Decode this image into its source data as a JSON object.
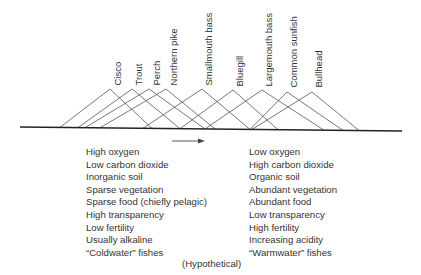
{
  "diagram": {
    "baseline": {
      "x1": 20,
      "y1": 127,
      "x2": 402,
      "y2": 131
    },
    "species": [
      {
        "name": "Cisco",
        "peak": [
          110,
          89
        ],
        "left_foot": 60,
        "right_foot": 152,
        "label_x": 113,
        "label_y": 85
      },
      {
        "name": "Trout",
        "peak": [
          132,
          89
        ],
        "left_foot": 78,
        "right_foot": 180,
        "label_x": 134,
        "label_y": 85
      },
      {
        "name": "Perch",
        "peak": [
          149,
          89
        ],
        "left_foot": 85,
        "right_foot": 205,
        "label_x": 152,
        "label_y": 85
      },
      {
        "name": "Northern pike",
        "peak": [
          166,
          89
        ],
        "left_foot": 100,
        "right_foot": 215,
        "label_x": 169,
        "label_y": 85
      },
      {
        "name": "Smallmouth bass",
        "peak": [
          202,
          89
        ],
        "left_foot": 143,
        "right_foot": 250,
        "label_x": 204,
        "label_y": 85
      },
      {
        "name": "Bluegill",
        "peak": [
          233,
          90
        ],
        "left_foot": 180,
        "right_foot": 278,
        "label_x": 235,
        "label_y": 86
      },
      {
        "name": "Largemouth bass",
        "peak": [
          262,
          90
        ],
        "left_foot": 205,
        "right_foot": 324,
        "label_x": 264,
        "label_y": 86
      },
      {
        "name": "Common sunfish",
        "peak": [
          287,
          92
        ],
        "left_foot": 250,
        "right_foot": 343,
        "label_x": 289,
        "label_y": 87
      },
      {
        "name": "Bullhead",
        "peak": [
          312,
          92
        ],
        "left_foot": 252,
        "right_foot": 359,
        "label_x": 314,
        "label_y": 87
      }
    ],
    "arrow": "→"
  },
  "conditions": {
    "left": [
      "High oxygen",
      "Low carbon dioxide",
      "Inorganic soil",
      "Sparse vegetation",
      "Sparse food (chiefly pelagic)",
      "High transparency",
      "Low fertility",
      "Usually alkaline",
      "“Coldwater” fishes"
    ],
    "right": [
      "Low oxygen",
      "High carbon dioxide",
      "Organic soil",
      "Abundant vegetation",
      "Abundant food",
      "Low transparency",
      "High fertility",
      "Increasing acidity",
      "“Warmwater” fishes"
    ]
  },
  "footnote": "(Hypothetical)",
  "colors": {
    "line": "#555555",
    "baseline": "#222222",
    "text": "#333333"
  }
}
